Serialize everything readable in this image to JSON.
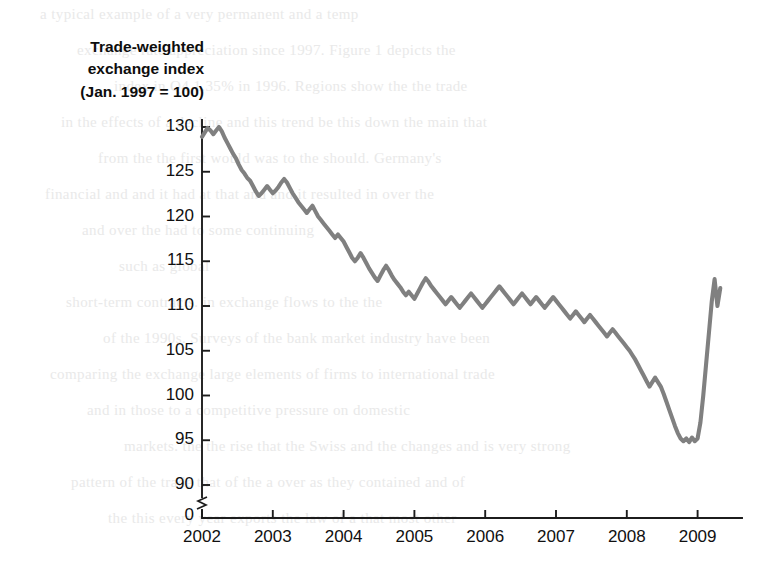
{
  "chart_data": {
    "type": "line",
    "title": "Trade-weighted\nexchange index\n(Jan. 1997 = 100)",
    "title_lines": [
      "Trade-weighted",
      "exchange index",
      "(Jan. 1997 = 100)"
    ],
    "xlabel": "",
    "ylabel": "Trade-weighted exchange index (Jan. 1997 = 100)",
    "grid": false,
    "legend": "none",
    "axis_break": true,
    "axis_break_note": "y-axis broken between 0 and 90",
    "ylim": [
      90,
      130.5
    ],
    "xlim": [
      2002.0,
      2009.35
    ],
    "yticks": [
      90,
      95,
      100,
      105,
      110,
      115,
      120,
      125,
      130
    ],
    "ytick_labels": [
      "90",
      "95",
      "100",
      "105",
      "110",
      "115",
      "120",
      "125",
      "130"
    ],
    "y_origin_label": "0",
    "xticks": [
      2002,
      2003,
      2004,
      2005,
      2006,
      2007,
      2008,
      2009
    ],
    "xtick_labels": [
      "2002",
      "2003",
      "2004",
      "2005",
      "2006",
      "2007",
      "2008",
      "2009"
    ],
    "line_color": "#808080",
    "axis_color": "#1c1c1c",
    "series": [
      {
        "name": "Trade-weighted exchange index",
        "x": [
          2002.0,
          2002.04,
          2002.08,
          2002.12,
          2002.16,
          2002.2,
          2002.24,
          2002.28,
          2002.32,
          2002.36,
          2002.4,
          2002.44,
          2002.48,
          2002.52,
          2002.56,
          2002.6,
          2002.64,
          2002.68,
          2002.72,
          2002.76,
          2002.8,
          2002.84,
          2002.88,
          2002.92,
          2002.96,
          2003.0,
          2003.04,
          2003.08,
          2003.12,
          2003.16,
          2003.2,
          2003.24,
          2003.28,
          2003.32,
          2003.36,
          2003.4,
          2003.44,
          2003.48,
          2003.52,
          2003.56,
          2003.6,
          2003.64,
          2003.68,
          2003.72,
          2003.76,
          2003.8,
          2003.84,
          2003.88,
          2003.92,
          2003.96,
          2004.0,
          2004.04,
          2004.08,
          2004.12,
          2004.16,
          2004.2,
          2004.24,
          2004.28,
          2004.32,
          2004.36,
          2004.4,
          2004.44,
          2004.48,
          2004.52,
          2004.56,
          2004.6,
          2004.64,
          2004.68,
          2004.72,
          2004.76,
          2004.8,
          2004.84,
          2004.88,
          2004.92,
          2004.96,
          2005.0,
          2005.04,
          2005.08,
          2005.12,
          2005.16,
          2005.2,
          2005.24,
          2005.28,
          2005.32,
          2005.36,
          2005.4,
          2005.44,
          2005.48,
          2005.52,
          2005.56,
          2005.6,
          2005.64,
          2005.68,
          2005.72,
          2005.76,
          2005.8,
          2005.84,
          2005.88,
          2005.92,
          2005.96,
          2006.0,
          2006.04,
          2006.08,
          2006.12,
          2006.16,
          2006.2,
          2006.24,
          2006.28,
          2006.32,
          2006.36,
          2006.4,
          2006.44,
          2006.48,
          2006.52,
          2006.56,
          2006.6,
          2006.64,
          2006.68,
          2006.72,
          2006.76,
          2006.8,
          2006.84,
          2006.88,
          2006.92,
          2006.96,
          2007.0,
          2007.04,
          2007.08,
          2007.12,
          2007.16,
          2007.2,
          2007.24,
          2007.28,
          2007.32,
          2007.36,
          2007.4,
          2007.44,
          2007.48,
          2007.52,
          2007.56,
          2007.6,
          2007.64,
          2007.68,
          2007.72,
          2007.76,
          2007.8,
          2007.84,
          2007.88,
          2007.92,
          2007.96,
          2008.0,
          2008.04,
          2008.08,
          2008.12,
          2008.16,
          2008.2,
          2008.24,
          2008.28,
          2008.32,
          2008.36,
          2008.4,
          2008.44,
          2008.48,
          2008.52,
          2008.56,
          2008.6,
          2008.64,
          2008.68,
          2008.72,
          2008.76,
          2008.8,
          2008.84,
          2008.88,
          2008.92,
          2008.96,
          2009.0,
          2009.04,
          2009.08,
          2009.12,
          2009.16,
          2009.2,
          2009.24,
          2009.28,
          2009.32
        ],
        "values": [
          128.9,
          129.4,
          129.9,
          129.6,
          129.2,
          129.6,
          130.0,
          129.5,
          128.8,
          128.2,
          127.6,
          127.0,
          126.5,
          125.8,
          125.2,
          124.8,
          124.3,
          124.0,
          123.4,
          122.8,
          122.3,
          122.6,
          123.0,
          123.4,
          123.0,
          122.6,
          122.9,
          123.3,
          123.8,
          124.2,
          123.8,
          123.2,
          122.6,
          122.1,
          121.6,
          121.2,
          120.8,
          120.4,
          120.8,
          121.2,
          120.6,
          120.0,
          119.6,
          119.2,
          118.8,
          118.4,
          118.0,
          117.6,
          118.0,
          117.6,
          117.2,
          116.6,
          116.0,
          115.4,
          115.0,
          115.4,
          115.9,
          115.4,
          114.8,
          114.2,
          113.7,
          113.2,
          112.8,
          113.4,
          114.0,
          114.5,
          114.0,
          113.4,
          112.9,
          112.5,
          112.1,
          111.6,
          111.2,
          111.6,
          111.2,
          110.8,
          111.4,
          112.0,
          112.6,
          113.1,
          112.7,
          112.2,
          111.8,
          111.4,
          111.0,
          110.6,
          110.2,
          110.6,
          111.0,
          110.6,
          110.2,
          109.8,
          110.2,
          110.6,
          111.0,
          111.4,
          111.0,
          110.6,
          110.2,
          109.8,
          110.2,
          110.6,
          111.0,
          111.4,
          111.8,
          112.2,
          111.8,
          111.4,
          111.0,
          110.6,
          110.2,
          110.6,
          111.0,
          111.4,
          111.0,
          110.6,
          110.2,
          110.6,
          111.0,
          110.6,
          110.2,
          109.8,
          110.2,
          110.6,
          111.0,
          110.6,
          110.2,
          109.8,
          109.4,
          109.0,
          108.6,
          109.0,
          109.4,
          109.0,
          108.6,
          108.2,
          108.6,
          109.0,
          108.6,
          108.2,
          107.8,
          107.4,
          107.0,
          106.6,
          107.0,
          107.4,
          107.0,
          106.6,
          106.2,
          105.8,
          105.4,
          105.0,
          104.5,
          104.0,
          103.4,
          102.8,
          102.2,
          101.6,
          101.0,
          101.5,
          102.0,
          101.5,
          101.0,
          100.2,
          99.3,
          98.4,
          97.5,
          96.6,
          95.8,
          95.2,
          94.9,
          95.2,
          94.8,
          95.3,
          94.9,
          95.2,
          97.0,
          100.0,
          103.5,
          107.0,
          110.5,
          113.0,
          110.0,
          112.0
        ]
      }
    ],
    "annotations": []
  },
  "bleed_text": {
    "lines": [
      "a typical example of a very permanent and a temp",
      "exchange rate appreciation since 1997. Figure 1 depicts the",
      "index in Q4 1.35% in 1996. Regions show the the trade",
      "in the effects of a decline and this trend be this down the main that",
      "from the the first would was to the should. Germany's",
      "financial and and it had at that and and it resulted in over the",
      "and over the had to some continuing",
      "such as global",
      "short-term contracts. in exchange flows to the the",
      "of the 1990s. Surveys of the bank market industry have been",
      "comparing the exchange large elements of firms to international trade",
      "and in those to a competitive pressure on domestic",
      "markets. the the rise that the Swiss and the changes and is very strong",
      "pattern of the trade that of the a over as they contained and of",
      "the this every year exports the law of a that most other"
    ]
  }
}
